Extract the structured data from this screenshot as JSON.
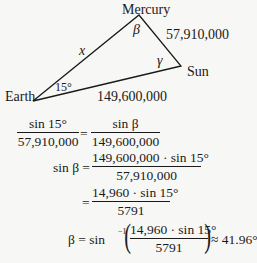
{
  "diagram": {
    "vertices": {
      "mercury": {
        "label": "Mercury",
        "x": 139,
        "y": 15
      },
      "sun": {
        "label": "Sun",
        "x": 181,
        "y": 66
      },
      "earth": {
        "label": "Earth",
        "x": 33,
        "y": 101
      }
    },
    "sides": {
      "earth_mercury": "x",
      "mercury_sun": "57,910,000",
      "earth_sun": "149,600,000"
    },
    "angles": {
      "earth": "15°",
      "mercury": "β",
      "sun": "γ"
    },
    "line_color": "#1a1a1a"
  },
  "equations": {
    "eq1": {
      "left_num": "sin 15°",
      "left_den": "57,910,000",
      "equals": "=",
      "right_num": "sin β",
      "right_den": "149,600,000"
    },
    "eq2": {
      "lhs": "sin β =",
      "num": "149,600,000 · sin 15°",
      "den": "57,910,000"
    },
    "eq3": {
      "equals": "=",
      "num": "14,960 · sin 15°",
      "den": "5791"
    },
    "eq4": {
      "lhs": "β = sin",
      "inverse": "−1",
      "num": "14,960 · sin 15°",
      "den": "5791",
      "result": "≈ 41.96°"
    }
  }
}
